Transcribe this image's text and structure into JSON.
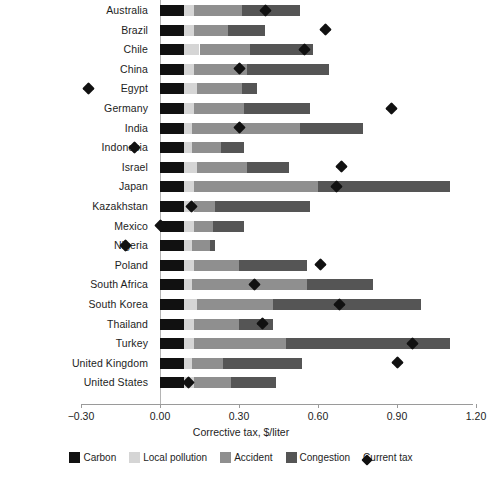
{
  "chart_data": {
    "type": "bar",
    "orientation": "horizontal",
    "stacked": true,
    "title": "",
    "xlabel": "Corrective tax, $/liter",
    "ylabel": "",
    "xlim": [
      -0.3,
      1.2
    ],
    "xticks": [
      "−0.30",
      "0.00",
      "0.30",
      "0.60",
      "0.90",
      "1.20"
    ],
    "xtick_values": [
      -0.3,
      0.0,
      0.3,
      0.6,
      0.9,
      1.2
    ],
    "grid": false,
    "legend_position": "bottom",
    "legend": [
      "Carbon",
      "Local pollution",
      "Accident",
      "Congestion",
      "Current tax"
    ],
    "colors": {
      "carbon": "#111111",
      "local_pollution": "#d5d5d5",
      "accident": "#8f8f8f",
      "congestion": "#555555",
      "current_tax": "#111111"
    },
    "categories": [
      "Australia",
      "Brazil",
      "Chile",
      "China",
      "Egypt",
      "Germany",
      "India",
      "Indonesia",
      "Israel",
      "Japan",
      "Kazakhstan",
      "Mexico",
      "Nigeria",
      "Poland",
      "South Africa",
      "South Korea",
      "Thailand",
      "Turkey",
      "United Kingdom",
      "United States"
    ],
    "series": [
      {
        "name": "Carbon",
        "values": [
          0.09,
          0.09,
          0.09,
          0.09,
          0.09,
          0.09,
          0.09,
          0.09,
          0.09,
          0.09,
          0.09,
          0.09,
          0.09,
          0.09,
          0.09,
          0.09,
          0.09,
          0.09,
          0.09,
          0.09
        ]
      },
      {
        "name": "Local pollution",
        "values": [
          0.04,
          0.04,
          0.06,
          0.04,
          0.05,
          0.04,
          0.03,
          0.03,
          0.05,
          0.04,
          0.04,
          0.04,
          0.03,
          0.04,
          0.03,
          0.05,
          0.04,
          0.04,
          0.03,
          0.04
        ]
      },
      {
        "name": "Accident",
        "values": [
          0.18,
          0.13,
          0.19,
          0.2,
          0.17,
          0.19,
          0.41,
          0.11,
          0.19,
          0.47,
          0.08,
          0.07,
          0.07,
          0.17,
          0.44,
          0.29,
          0.17,
          0.35,
          0.12,
          0.14
        ]
      },
      {
        "name": "Congestion",
        "values": [
          0.22,
          0.14,
          0.24,
          0.31,
          0.06,
          0.25,
          0.24,
          0.09,
          0.16,
          0.5,
          0.36,
          0.12,
          0.02,
          0.26,
          0.25,
          0.56,
          0.13,
          0.62,
          0.3,
          0.17
        ]
      }
    ],
    "totals": [
      0.53,
      0.4,
      0.58,
      0.64,
      0.37,
      0.57,
      0.77,
      0.32,
      0.49,
      1.1,
      0.57,
      0.32,
      0.21,
      0.56,
      0.81,
      0.99,
      0.43,
      1.1,
      0.54,
      0.44
    ],
    "current_tax": {
      "name": "Current tax",
      "values": [
        0.4,
        0.63,
        0.55,
        0.3,
        -0.27,
        0.88,
        0.3,
        -0.095,
        0.69,
        0.67,
        0.12,
        0.0,
        -0.13,
        0.61,
        0.36,
        0.68,
        0.39,
        0.96,
        0.9,
        0.11
      ]
    }
  },
  "legend": {
    "items": [
      {
        "key": "carbon",
        "label": "Carbon"
      },
      {
        "key": "localpol",
        "label": "Local pollution"
      },
      {
        "key": "accident",
        "label": "Accident"
      },
      {
        "key": "congestion",
        "label": "Congestion"
      },
      {
        "key": "diamond",
        "label": "Current tax"
      }
    ]
  }
}
